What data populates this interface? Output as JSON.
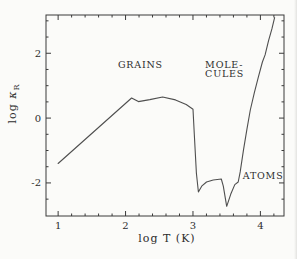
{
  "window": {
    "background": "#fbfbf9"
  },
  "chart_data": {
    "type": "line",
    "title": "",
    "xlabel": "log T (K)",
    "ylabel": "log κR",
    "ylabel_log": "log ",
    "ylabel_kappa": "κ",
    "ylabel_sub": "R",
    "xlim": [
      0.82,
      4.35
    ],
    "ylim": [
      -3.02,
      3.18
    ],
    "grid": false,
    "legend": false,
    "x_major_ticks": [
      1,
      2,
      3,
      4
    ],
    "x_tick_labels": [
      "1",
      "2",
      "3",
      "4"
    ],
    "x_minor_ticks": [
      1.2,
      1.4,
      1.6,
      1.8,
      2.2,
      2.4,
      2.6,
      2.8,
      3.2,
      3.4,
      3.6,
      3.8,
      4.2
    ],
    "y_major_ticks": [
      -2,
      0,
      2
    ],
    "y_tick_labels": [
      "-2",
      "0",
      "2"
    ],
    "y_minor_ticks": [
      -2.5,
      -1.5,
      -1.0,
      -0.5,
      0.5,
      1.0,
      1.5,
      2.5,
      3.0
    ],
    "series": [
      {
        "name": "rosseland-mean-opacity",
        "points": [
          [
            1.0,
            -1.4
          ],
          [
            2.09,
            0.62
          ],
          [
            2.19,
            0.51
          ],
          [
            2.36,
            0.57
          ],
          [
            2.55,
            0.65
          ],
          [
            2.74,
            0.56
          ],
          [
            2.9,
            0.42
          ],
          [
            3.0,
            0.27
          ],
          [
            3.02,
            -0.5
          ],
          [
            3.05,
            -1.7
          ],
          [
            3.08,
            -2.28
          ],
          [
            3.13,
            -2.1
          ],
          [
            3.2,
            -1.97
          ],
          [
            3.3,
            -1.91
          ],
          [
            3.42,
            -1.88
          ],
          [
            3.45,
            -2.1
          ],
          [
            3.5,
            -2.72
          ],
          [
            3.56,
            -2.35
          ],
          [
            3.62,
            -2.05
          ],
          [
            3.67,
            -1.97
          ],
          [
            3.7,
            -1.66
          ],
          [
            3.75,
            -0.98
          ],
          [
            3.8,
            -0.35
          ],
          [
            3.85,
            0.25
          ],
          [
            3.91,
            0.78
          ],
          [
            3.97,
            1.27
          ],
          [
            4.03,
            1.73
          ],
          [
            4.07,
            1.95
          ],
          [
            4.12,
            2.38
          ],
          [
            4.17,
            2.75
          ],
          [
            4.21,
            3.1
          ]
        ]
      }
    ],
    "annotations": [
      {
        "name": "grains-label",
        "text": "GRAINS",
        "x": 2.22,
        "y": 1.63,
        "anchor": "middle"
      },
      {
        "name": "molecules-label-line1",
        "text": "MOLE-",
        "x": 3.18,
        "y": 1.65,
        "anchor": "start"
      },
      {
        "name": "molecules-label-line2",
        "text": "CULES",
        "x": 3.18,
        "y": 1.35,
        "anchor": "start"
      },
      {
        "name": "atoms-label",
        "text": "ATOMS",
        "x": 4.04,
        "y": -1.79,
        "anchor": "middle"
      }
    ],
    "colors": {
      "curve": "#4f4f4f",
      "frame": "#3a3a3a",
      "text": "#2d2d2d",
      "background": "#fbfbf9"
    }
  }
}
